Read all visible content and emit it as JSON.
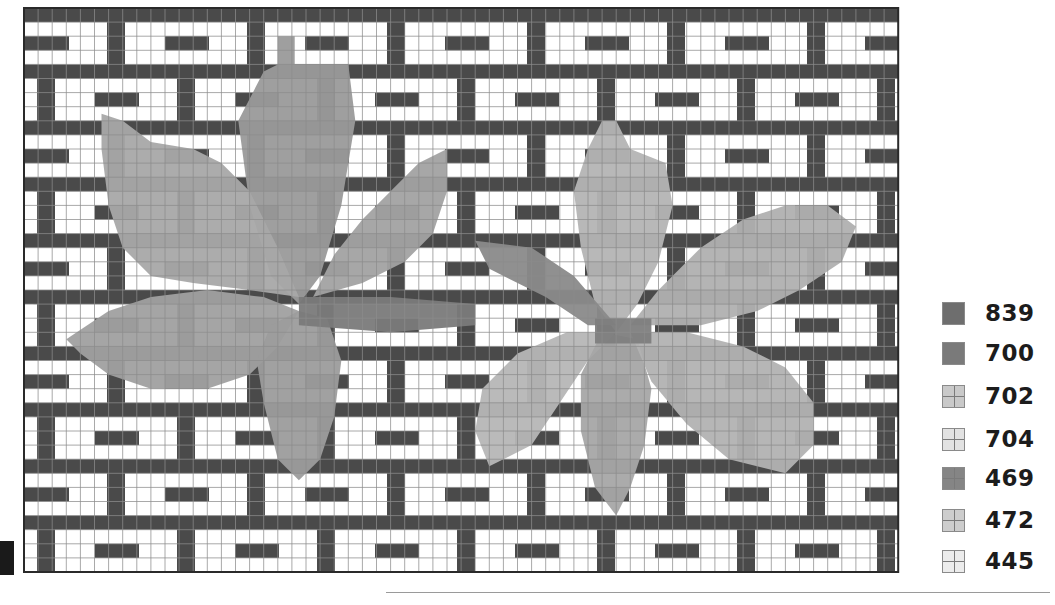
{
  "chart": {
    "title": "",
    "grid": {
      "cols": 62,
      "rows": 40,
      "cell_w": 14.1,
      "cell_h": 14.1
    },
    "colors": {
      "mortar": "#4a4a4a",
      "brick_bg": "#ffffff",
      "brick_bar": "#4a4a4a",
      "grid_line": "#8c8c8c",
      "border": "#2a2a2a"
    },
    "brick_pattern": {
      "course_rows": 4,
      "mortar_rows": 1,
      "pitch_px": 140,
      "brick_w_px": 122,
      "offset_even_px": 101,
      "offset_odd_px": 31,
      "bar_offset_px": 40,
      "bar_w_px": 44
    },
    "leaves": [
      {
        "name": "leaf-left",
        "shapes": [
          {
            "part": "top-lobe",
            "fill": "#9a9a9a",
            "points": [
              [
                18,
                2
              ],
              [
                19.2,
                2
              ],
              [
                19.2,
                4
              ],
              [
                23,
                4
              ],
              [
                23.5,
                8
              ],
              [
                22.5,
                14
              ],
              [
                21,
                19
              ],
              [
                19.5,
                21
              ],
              [
                17.5,
                19
              ],
              [
                16,
                14
              ],
              [
                15.2,
                8
              ],
              [
                17,
                4.5
              ],
              [
                18,
                4
              ]
            ]
          },
          {
            "part": "upper-left-lobe",
            "fill": "#a8a8a8",
            "points": [
              [
                5.5,
                7.5
              ],
              [
                7,
                8
              ],
              [
                9,
                9.5
              ],
              [
                12,
                10
              ],
              [
                14,
                11
              ],
              [
                16,
                13
              ],
              [
                18,
                17
              ],
              [
                19.5,
                20.5
              ],
              [
                16,
                20
              ],
              [
                12,
                19.5
              ],
              [
                9,
                19
              ],
              [
                7,
                17
              ],
              [
                6,
                14
              ],
              [
                5.5,
                10
              ]
            ]
          },
          {
            "part": "upper-right-lobe",
            "fill": "#a2a2a2",
            "points": [
              [
                30,
                10
              ],
              [
                30,
                13
              ],
              [
                29,
                16
              ],
              [
                27,
                18
              ],
              [
                24,
                19.5
              ],
              [
                20.5,
                20.5
              ],
              [
                22,
                17.5
              ],
              [
                24,
                15
              ],
              [
                26,
                13
              ],
              [
                28,
                11
              ]
            ]
          },
          {
            "part": "lower-left-lobe",
            "fill": "#a0a0a0",
            "points": [
              [
                3,
                23.5
              ],
              [
                6,
                21.5
              ],
              [
                9,
                20.5
              ],
              [
                13,
                20
              ],
              [
                17,
                20.5
              ],
              [
                19.5,
                21.5
              ],
              [
                18,
                24
              ],
              [
                16,
                26
              ],
              [
                13,
                27
              ],
              [
                9,
                27
              ],
              [
                6,
                26
              ],
              [
                4,
                24.5
              ]
            ]
          },
          {
            "part": "bottom-lobe",
            "fill": "#9c9c9c",
            "points": [
              [
                19.5,
                21.5
              ],
              [
                21.5,
                22
              ],
              [
                22.5,
                25
              ],
              [
                22,
                29
              ],
              [
                21,
                32
              ],
              [
                19.5,
                33.5
              ],
              [
                18,
                32
              ],
              [
                17,
                28
              ],
              [
                16.5,
                25
              ],
              [
                17.5,
                22.5
              ]
            ]
          },
          {
            "part": "stem",
            "fill": "#7a7a7a",
            "points": [
              [
                19.5,
                20.5
              ],
              [
                26,
                20.5
              ],
              [
                32,
                21
              ],
              [
                32,
                22.5
              ],
              [
                26,
                23
              ],
              [
                19.5,
                22.5
              ]
            ]
          }
        ]
      },
      {
        "name": "leaf-right",
        "shapes": [
          {
            "part": "top-lobe",
            "fill": "#b4b4b4",
            "points": [
              [
                41,
                8
              ],
              [
                42,
                8
              ],
              [
                43,
                10
              ],
              [
                45.5,
                11
              ],
              [
                46,
                14
              ],
              [
                45,
                18
              ],
              [
                43.5,
                21
              ],
              [
                42,
                23
              ],
              [
                40.5,
                21
              ],
              [
                39.5,
                17
              ],
              [
                39,
                13
              ],
              [
                40,
                10
              ]
            ]
          },
          {
            "part": "upper-right-lobe",
            "fill": "#b0b0b0",
            "points": [
              [
                43,
                22.5
              ],
              [
                45,
                20
              ],
              [
                48,
                17
              ],
              [
                51,
                15
              ],
              [
                54,
                14
              ],
              [
                57,
                14
              ],
              [
                59,
                15.5
              ],
              [
                58,
                18
              ],
              [
                55,
                20
              ],
              [
                52,
                21.5
              ],
              [
                48,
                22.5
              ]
            ]
          },
          {
            "part": "left-stem",
            "fill": "#8a8a8a",
            "points": [
              [
                32,
                16.5
              ],
              [
                36,
                17
              ],
              [
                39,
                19
              ],
              [
                42,
                22.5
              ],
              [
                40,
                22.5
              ],
              [
                37,
                20.5
              ],
              [
                33,
                18.5
              ]
            ]
          },
          {
            "part": "lower-left-lobe",
            "fill": "#b6b6b6",
            "points": [
              [
                42,
                23
              ],
              [
                40,
                25
              ],
              [
                38,
                28
              ],
              [
                36,
                31
              ],
              [
                33,
                32.5
              ],
              [
                32,
                30
              ],
              [
                32.5,
                27
              ],
              [
                35,
                24.5
              ],
              [
                38.5,
                23
              ]
            ]
          },
          {
            "part": "bottom-lobe",
            "fill": "#a6a6a6",
            "points": [
              [
                41,
                23
              ],
              [
                43.5,
                23.5
              ],
              [
                44.5,
                27
              ],
              [
                44,
                31
              ],
              [
                43,
                34
              ],
              [
                42,
                36
              ],
              [
                40.5,
                34
              ],
              [
                39.5,
                30
              ],
              [
                39.5,
                26
              ]
            ]
          },
          {
            "part": "lower-right-lobe",
            "fill": "#b2b2b2",
            "points": [
              [
                43,
                23
              ],
              [
                47,
                23
              ],
              [
                51,
                24
              ],
              [
                54,
                25.5
              ],
              [
                56,
                28
              ],
              [
                56,
                31
              ],
              [
                54,
                33
              ],
              [
                50,
                32
              ],
              [
                47,
                29.5
              ],
              [
                44.5,
                26.5
              ]
            ]
          },
          {
            "part": "stem",
            "fill": "#7e7e7e",
            "points": [
              [
                40.5,
                22
              ],
              [
                44.5,
                22
              ],
              [
                44.5,
                23.8
              ],
              [
                40.5,
                23.8
              ]
            ]
          }
        ]
      }
    ]
  },
  "legend": {
    "items": [
      {
        "code": "839",
        "color": "#6e6e6e",
        "gridded": false,
        "top": 2
      },
      {
        "code": "700",
        "color": "#7a7a7a",
        "gridded": true,
        "top": 42
      },
      {
        "code": "702",
        "color": "#c9c9c9",
        "gridded": true,
        "top": 85
      },
      {
        "code": "704",
        "color": "#e2e2e2",
        "gridded": true,
        "top": 128
      },
      {
        "code": "469",
        "color": "#858585",
        "gridded": true,
        "top": 167
      },
      {
        "code": "472",
        "color": "#cdcdcd",
        "gridded": true,
        "top": 209
      },
      {
        "code": "445",
        "color": "#ececec",
        "gridded": true,
        "top": 250
      }
    ]
  }
}
